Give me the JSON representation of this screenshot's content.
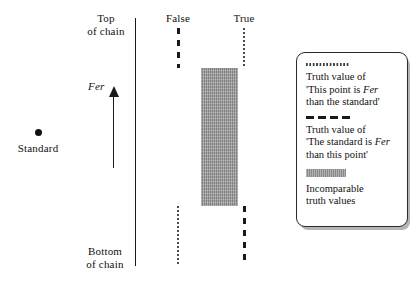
{
  "axis": {
    "top_label_line1": "Top",
    "top_label_line2": "of chain",
    "bottom_label_line1": "Bottom",
    "bottom_label_line2": "of chain",
    "direction_label": "Fer"
  },
  "standard": {
    "label": "Standard"
  },
  "columns": {
    "false_label": "False",
    "true_label": "True"
  },
  "legend": {
    "entries": [
      {
        "swatch": "dotted-line",
        "line1": "Truth value of",
        "line2_a": "'This point is ",
        "line2_italic": "Fer",
        "line3": "than the standard'"
      },
      {
        "swatch": "dashed-line",
        "line1": "Truth value of",
        "line2_a": "'The standard is ",
        "line2_italic": "Fer",
        "line3": "than this point'"
      },
      {
        "swatch": "gray-band",
        "line1": "Incomparable",
        "line2": "truth values"
      }
    ]
  },
  "chart_data": {
    "type": "line",
    "xlabel": "",
    "ylabel": "Fer",
    "grid": false,
    "legend_position": "right",
    "x_categories": [
      "False",
      "True"
    ],
    "y_axis": {
      "top_label": "Top of chain",
      "bottom_label": "Bottom of chain",
      "direction": "Fer (increasing upward)"
    },
    "annotations": [
      {
        "name": "Standard",
        "type": "point",
        "x": 38,
        "y": 133
      }
    ],
    "series": [
      {
        "name": "Truth value of 'This point is Fer than the standard'",
        "style": "dotted",
        "segments": [
          {
            "x": "True",
            "y_from": "top of chain",
            "y_to": "top of incomparable band"
          },
          {
            "x": "False",
            "y_from": "bottom of incomparable band",
            "y_to": "bottom of chain"
          }
        ]
      },
      {
        "name": "Truth value of 'The standard is Fer than this point'",
        "style": "dashed",
        "segments": [
          {
            "x": "False",
            "y_from": "top of chain",
            "y_to": "top of incomparable band"
          },
          {
            "x": "True",
            "y_from": "bottom of incomparable band",
            "y_to": "bottom of chain"
          }
        ]
      },
      {
        "name": "Incomparable truth values",
        "style": "gray-band",
        "region": {
          "x_from": "False",
          "x_to": "True",
          "y_from": "upper-middle of chain",
          "y_to": "lower-middle of chain"
        }
      }
    ]
  }
}
